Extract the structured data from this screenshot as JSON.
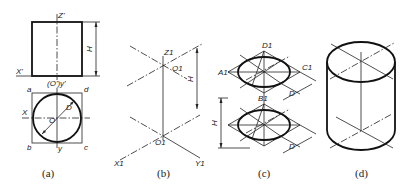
{
  "figure": {
    "panels": [
      {
        "id": "a",
        "caption": "(a)",
        "labels": {
          "z": "Z'",
          "x_front": "X'",
          "origin_front": "(O')y'",
          "h": "H",
          "a": "a",
          "d": "d",
          "b": "b",
          "c": "c",
          "x": "X",
          "o": "O",
          "y": "y",
          "dia": "D"
        }
      },
      {
        "id": "b",
        "caption": "(b)",
        "labels": {
          "z1": "Z1",
          "o1_top": "O1",
          "h": "H",
          "o1_bottom": "O1",
          "x1": "X1",
          "y1": "Y1"
        }
      },
      {
        "id": "c",
        "caption": "(c)",
        "labels": {
          "d1": "D1",
          "a1": "A1",
          "c1": "C1",
          "b1": "B1",
          "d_top": "D",
          "h": "H",
          "d_bottom": "D"
        }
      },
      {
        "id": "d",
        "caption": "(d)",
        "labels": {}
      }
    ]
  }
}
